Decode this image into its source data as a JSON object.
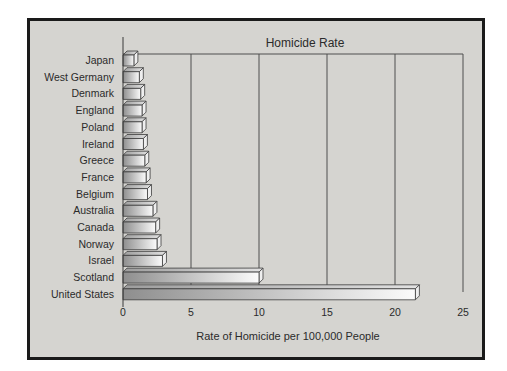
{
  "figure": {
    "title": "Homicide Rate",
    "xlabel": "Rate of Homicide per 100,000 People"
  },
  "chart_data": {
    "type": "bar",
    "orientation": "horizontal",
    "title": "Homicide Rate",
    "xlabel": "Rate of Homicide per 100,000 People",
    "categories": [
      "Japan",
      "West Germany",
      "Denmark",
      "England",
      "Poland",
      "Ireland",
      "Greece",
      "France",
      "Belgium",
      "Australia",
      "Canada",
      "Norway",
      "Israel",
      "Scotland",
      "United States"
    ],
    "values": [
      0.8,
      1.2,
      1.3,
      1.4,
      1.4,
      1.5,
      1.6,
      1.7,
      1.8,
      2.2,
      2.4,
      2.5,
      2.9,
      10.0,
      21.5
    ],
    "xlim": [
      0,
      25
    ],
    "xticks": [
      0,
      5,
      10,
      15,
      20,
      25
    ],
    "grid": true,
    "legend": false,
    "style": {
      "panel_bg": "#d5d4d0",
      "frame_color": "#1a1a1a",
      "line_color": "#4e4e4e",
      "bar_outline": "#3c3c3c",
      "bar_gradient_from": "#8e8e8e",
      "bar_gradient_to": "#fbfbfb",
      "bar_top_from": "#9d9d9d",
      "bar_top_to": "#e2e2e2",
      "bar_side": "#efefef",
      "text_color": "#2b2b2b"
    }
  }
}
